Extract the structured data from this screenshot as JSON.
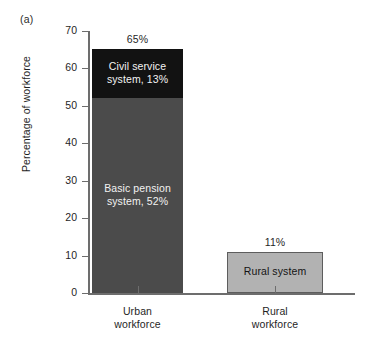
{
  "panel": {
    "letter": "(a)"
  },
  "chart_data": {
    "type": "bar",
    "subtype": "stacked",
    "title": "",
    "xlabel": "",
    "ylabel": "Percentage of workforce",
    "ylim": [
      0,
      70
    ],
    "ytick_labels": [
      "70",
      "60",
      "50",
      "40",
      "30",
      "20",
      "10",
      "0"
    ],
    "ytick_values": [
      70,
      60,
      50,
      40,
      30,
      20,
      10,
      0
    ],
    "grid": false,
    "legend": "none",
    "categories": [
      "Urban\nworkforce",
      "Rural\nworkforce"
    ],
    "bars": [
      {
        "category_line1": "Urban",
        "category_line2": "workforce",
        "total": 65,
        "total_label": "65%",
        "segments": [
          {
            "name": "Civil service system",
            "label_line1": "Civil service",
            "label_line2": "system, 13%",
            "value": 13,
            "color": "#121212",
            "text_color": "#f2f2f2"
          },
          {
            "name": "Basic pension system",
            "label_line1": "Basic pension",
            "label_line2": "system, 52%",
            "value": 52,
            "color": "#4b4b4b",
            "text_color": "#f2f2f2"
          }
        ]
      },
      {
        "category_line1": "Rural",
        "category_line2": "workforce",
        "total": 11,
        "total_label": "11%",
        "segments": [
          {
            "name": "Rural system",
            "label_line1": "Rural system",
            "label_line2": "",
            "value": 11,
            "color": "#b2b2b2",
            "text_color": "#141414"
          }
        ]
      }
    ],
    "axis_color": "#6d6d6d"
  }
}
